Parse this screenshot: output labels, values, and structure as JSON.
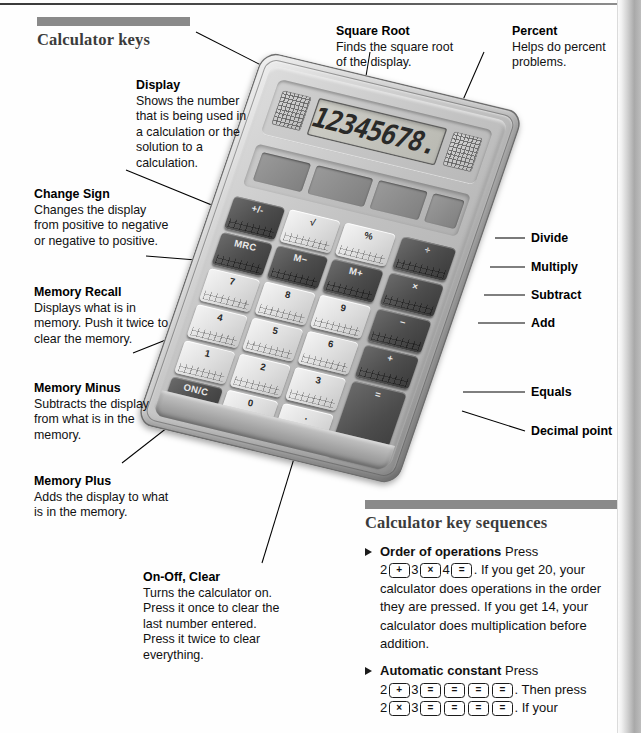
{
  "page": {
    "section_title": "Calculator keys",
    "sequences_title": "Calculator key sequences"
  },
  "callouts": {
    "display": {
      "title": "Display",
      "body": "Shows the number that is being used in a calculation or the solution to a calculation."
    },
    "change_sign": {
      "title": "Change Sign",
      "body": "Changes the display from positive to negative or negative to positive."
    },
    "memory_recall": {
      "title": "Memory Recall",
      "body": "Displays what is in memory. Push it twice to clear the memory."
    },
    "memory_minus": {
      "title": "Memory Minus",
      "body": "Subtracts the display from what is in the memory."
    },
    "memory_plus": {
      "title": "Memory Plus",
      "body": "Adds the display to what is in the memory."
    },
    "on_off_clear": {
      "title": "On-Off, Clear",
      "body": "Turns the calculator on. Press it once to clear the last number entered. Press it twice to clear everything."
    },
    "square_root": {
      "title": "Square Root",
      "body": "Finds the square root of the display."
    },
    "percent": {
      "title": "Percent",
      "body": "Helps do percent problems."
    }
  },
  "right_labels": [
    {
      "label": "Divide"
    },
    {
      "label": "Multiply"
    },
    {
      "label": "Subtract"
    },
    {
      "label": "Add"
    },
    {
      "label": "Equals"
    },
    {
      "label": "Decimal point"
    }
  ],
  "calculator": {
    "display_value": "12345678.",
    "keys": [
      {
        "label": "+/-",
        "style": "dark"
      },
      {
        "label": "√",
        "style": "light"
      },
      {
        "label": "%",
        "style": "light"
      },
      {
        "label": "÷",
        "style": "dark"
      },
      {
        "label": "MRC",
        "style": "dark"
      },
      {
        "label": "M−",
        "style": "dark"
      },
      {
        "label": "M+",
        "style": "dark"
      },
      {
        "label": "×",
        "style": "dark"
      },
      {
        "label": "7",
        "style": "light"
      },
      {
        "label": "8",
        "style": "light"
      },
      {
        "label": "9",
        "style": "light"
      },
      {
        "label": "−",
        "style": "dark"
      },
      {
        "label": "4",
        "style": "light"
      },
      {
        "label": "5",
        "style": "light"
      },
      {
        "label": "6",
        "style": "light"
      },
      {
        "label": "+",
        "style": "dark"
      },
      {
        "label": "1",
        "style": "light"
      },
      {
        "label": "2",
        "style": "light"
      },
      {
        "label": "3",
        "style": "light"
      },
      {
        "label": "=",
        "style": "dark"
      },
      {
        "label": "ON/C",
        "style": "dark"
      },
      {
        "label": "0",
        "style": "light"
      },
      {
        "label": ".",
        "style": "light"
      }
    ]
  },
  "sequences": [
    {
      "title": "Order of operations",
      "intro": "Press",
      "tokens": [
        "2",
        "[+]",
        "3",
        "[×]",
        "4",
        "[=]"
      ],
      "after": ". If you get 20, your calculator does operations in the order they are pressed. If you get 14, your calculator does multiplication before addition."
    },
    {
      "title": "Automatic constant",
      "intro": "Press",
      "tokens": [
        "2",
        "[+]",
        "3",
        "[=]",
        "[=]",
        "[=]",
        "[=]"
      ],
      "after": ". Then press",
      "tokens2": [
        "2",
        "[×]",
        "3",
        "[=]",
        "[=]",
        "[=]",
        "[=]"
      ],
      "after2": ". If your"
    }
  ],
  "colors": {
    "rule": "#8a8a8a",
    "heading": "#3b3b3b",
    "text": "#111111"
  }
}
